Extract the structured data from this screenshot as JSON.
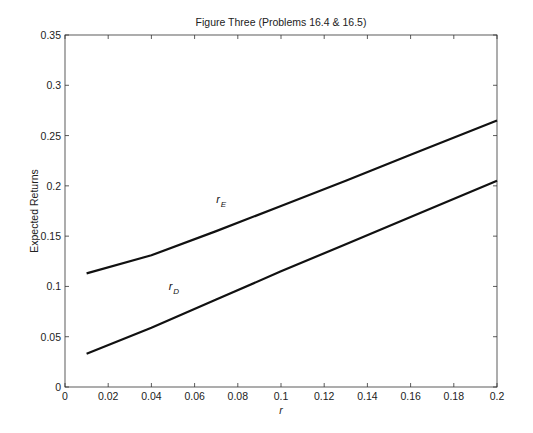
{
  "chart_data": {
    "type": "line",
    "title": "Figure Three (Problems 16.4 & 16.5)",
    "xlabel": "r",
    "ylabel": "Expected Returns",
    "xlim": [
      0,
      0.2
    ],
    "ylim": [
      0,
      0.35
    ],
    "grid": false,
    "legend": null,
    "xticks": [
      0,
      0.02,
      0.04,
      0.06,
      0.08,
      0.1,
      0.12,
      0.14,
      0.16,
      0.18,
      0.2
    ],
    "xtick_labels": [
      "0",
      "0.02",
      "0.04",
      "0.06",
      "0.08",
      "0.1",
      "0.12",
      "0.14",
      "0.16",
      "0.18",
      "0.2"
    ],
    "yticks": [
      0,
      0.05,
      0.1,
      0.15,
      0.2,
      0.25,
      0.3,
      0.35
    ],
    "ytick_labels": [
      "0",
      "0.05",
      "0.1",
      "0.15",
      "0.2",
      "0.25",
      "0.3",
      "0.35"
    ],
    "x": [
      0.01,
      0.04,
      0.07,
      0.1,
      0.13,
      0.16,
      0.2
    ],
    "series": [
      {
        "name": "r_E",
        "values": [
          0.113,
          0.131,
          0.155,
          0.18,
          0.205,
          0.231,
          0.265
        ]
      },
      {
        "name": "r_D",
        "values": [
          0.033,
          0.059,
          0.087,
          0.115,
          0.142,
          0.169,
          0.205
        ]
      }
    ],
    "annotations": [
      {
        "base": "r",
        "sub": "E",
        "x": 0.07,
        "y": 0.183
      },
      {
        "base": "r",
        "sub": "D",
        "x": 0.048,
        "y": 0.096
      }
    ]
  }
}
